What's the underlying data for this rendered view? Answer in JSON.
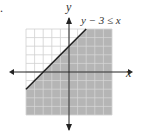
{
  "chart_data": {
    "type": "line",
    "title": "",
    "problem_marker": ".",
    "xlabel": "x",
    "ylabel": "y",
    "xlim": [
      -5,
      5
    ],
    "ylim": [
      -5,
      5
    ],
    "grid": true,
    "grid_step": 1,
    "boundary": {
      "equation": "y = x + 3",
      "slope": 1,
      "intercept": 3,
      "style": "solid"
    },
    "inequality_label": "y − 3 ≤ x",
    "shaded_region": "below-right of line (y ≤ x + 3)",
    "colors": {
      "shade": "#b5b5b5",
      "grid": "#d0d0d0",
      "axis": "#222222",
      "line": "#222222"
    }
  }
}
